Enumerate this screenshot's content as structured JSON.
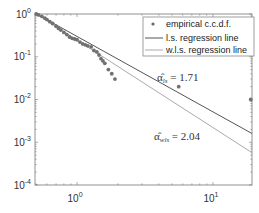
{
  "chart_data": {
    "type": "scatter",
    "title": "",
    "xlabel": "",
    "ylabel": "",
    "xscale": "log",
    "yscale": "log",
    "xlim": [
      0.49,
      19.4
    ],
    "ylim": [
      0.0001,
      1
    ],
    "grid": false,
    "legend_position": "upper right",
    "x_ticks": [
      {
        "base": "10",
        "exp": "0",
        "value": 1
      },
      {
        "base": "10",
        "exp": "1",
        "value": 10
      }
    ],
    "y_ticks": [
      {
        "base": "10",
        "exp": "0",
        "value": 1
      },
      {
        "base": "10",
        "exp": "-1",
        "value": 0.1
      },
      {
        "base": "10",
        "exp": "-2",
        "value": 0.01
      },
      {
        "base": "10",
        "exp": "-3",
        "value": 0.001
      },
      {
        "base": "10",
        "exp": "-4",
        "value": 0.0001
      }
    ],
    "legend": [
      {
        "label": "empirical c.c.d.f.",
        "style": "marker"
      },
      {
        "label": "l.s. regression line",
        "style": "line",
        "color": "#555555"
      },
      {
        "label": "w.l.s. regression line",
        "style": "line",
        "color": "#aaaaaa"
      }
    ],
    "series": [
      {
        "name": "empirical c.c.d.f.",
        "kind": "points",
        "x": [
          0.5,
          0.52,
          0.55,
          0.58,
          0.6,
          0.63,
          0.66,
          0.7,
          0.73,
          0.76,
          0.8,
          0.84,
          0.88,
          0.92,
          0.96,
          1.0,
          1.05,
          1.1,
          1.15,
          1.2,
          1.27,
          1.33,
          1.4,
          1.45,
          1.5,
          1.55,
          1.6,
          1.7,
          1.8,
          1.9,
          5.6,
          19.0
        ],
        "y": [
          1.0,
          0.95,
          0.88,
          0.8,
          0.74,
          0.66,
          0.6,
          0.52,
          0.46,
          0.42,
          0.37,
          0.33,
          0.29,
          0.27,
          0.26,
          0.25,
          0.22,
          0.2,
          0.19,
          0.18,
          0.17,
          0.14,
          0.13,
          0.11,
          0.09,
          0.08,
          0.07,
          0.05,
          0.04,
          0.03,
          0.02,
          0.01
        ]
      },
      {
        "name": "l.s. regression line",
        "kind": "line",
        "alpha": 1.71,
        "x": [
          0.49,
          19.4
        ],
        "y": [
          1.05,
          0.0016
        ],
        "color": "#555555"
      },
      {
        "name": "w.l.s. regression line",
        "kind": "line",
        "alpha": 2.04,
        "x": [
          0.49,
          19.4
        ],
        "y": [
          1.05,
          0.00057
        ],
        "color": "#aaaaaa"
      }
    ],
    "annotations": [
      {
        "symbol": "α̂",
        "subscript": "ls",
        "text": " = 1.71"
      },
      {
        "symbol": "α̂",
        "subscript": "wls",
        "text": " = 2.04"
      }
    ]
  }
}
